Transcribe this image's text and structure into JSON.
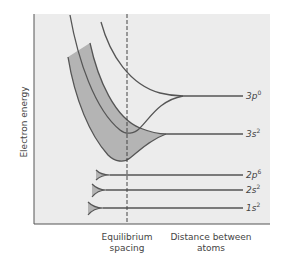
{
  "diagram": {
    "y_axis_label": "Electron energy",
    "x_labels": {
      "equilibrium_line1": "Equilibrium",
      "equilibrium_line2": "spacing",
      "distance_line1": "Distance between",
      "distance_line2": "atoms"
    },
    "levels": [
      {
        "name": "3p",
        "sup": "0"
      },
      {
        "name": "3s",
        "sup": "2"
      },
      {
        "name": "2p",
        "sup": "6"
      },
      {
        "name": "2s",
        "sup": "2"
      },
      {
        "name": "1s",
        "sup": "2"
      }
    ],
    "colors": {
      "background": "#ececec",
      "band_fill": "#b4b4b4",
      "line": "#555555",
      "axis": "#555555"
    }
  }
}
